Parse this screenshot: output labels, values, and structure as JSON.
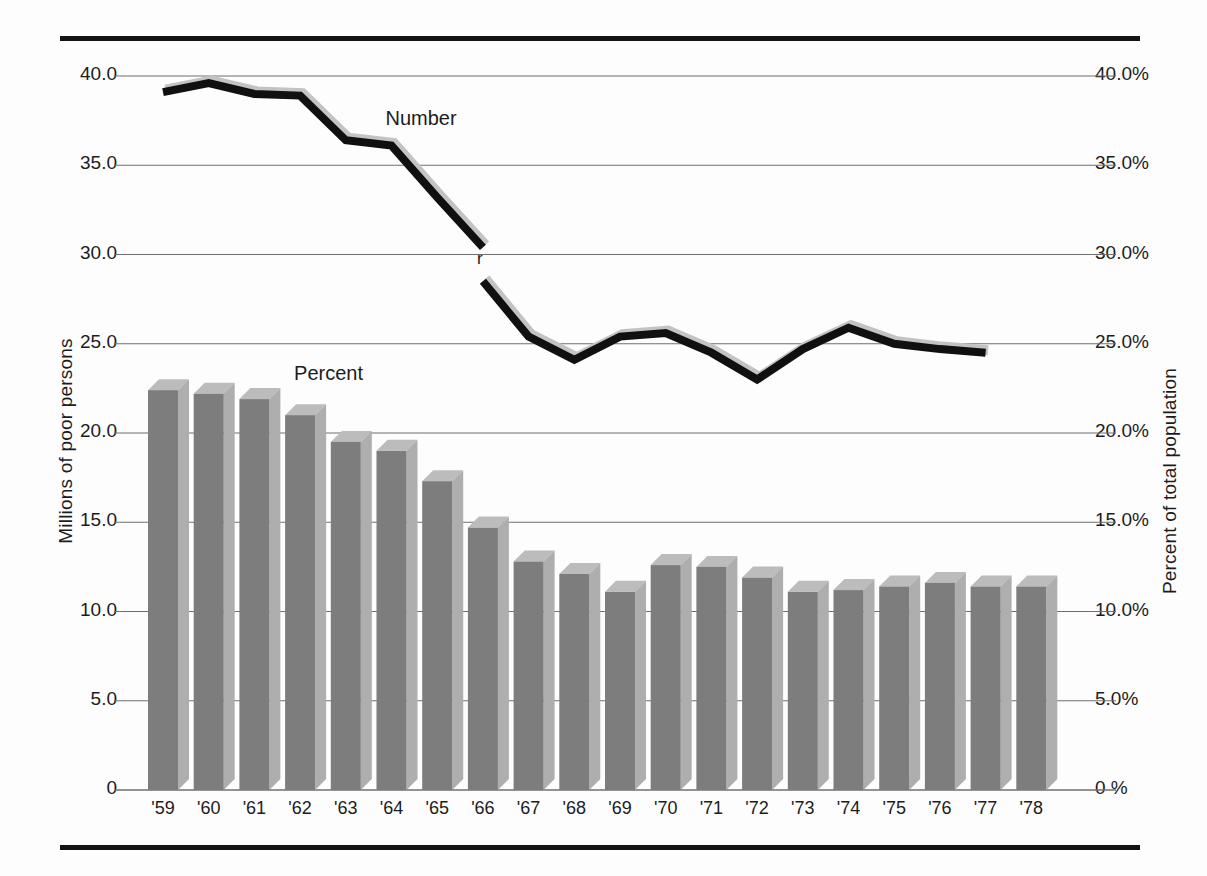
{
  "figure": {
    "left_axis_title": "Millions of  poor persons",
    "right_axis_title": "Percent of  total population",
    "series_label_number": "Number",
    "series_label_percent": "Percent",
    "revision_note": "r"
  },
  "chart_data": {
    "type": "bar",
    "title": "",
    "subtitle": "",
    "xlabel": "",
    "ylabel": "Millions of  poor persons",
    "y2label": "Percent of  total population",
    "grid": true,
    "legend_position": "inline-annotations",
    "categories": [
      "'59",
      "'60",
      "'61",
      "'62",
      "'63",
      "'64",
      "'65",
      "'66",
      "'67",
      "'68",
      "'69",
      "'70",
      "'71",
      "'72",
      "'73",
      "'74",
      "'75",
      "'76",
      "'77",
      "'78"
    ],
    "ylim": [
      0,
      42.5
    ],
    "y2lim": [
      0,
      42.5
    ],
    "left_ticks": [
      "40.0",
      "35.0",
      "30.0",
      "25.0",
      "20.0",
      "15.0",
      "10.0",
      "5.0",
      "0"
    ],
    "left_tick_values": [
      40.0,
      35.0,
      30.0,
      25.0,
      20.0,
      15.0,
      10.0,
      5.0,
      0
    ],
    "right_ticks": [
      "40.0%",
      "35.0%",
      "30.0%",
      "25.0%",
      "20.0%",
      "15.0%",
      "10.0%",
      "5.0%",
      "0 %"
    ],
    "right_tick_values": [
      40.0,
      35.0,
      30.0,
      25.0,
      20.0,
      15.0,
      10.0,
      5.0,
      0
    ],
    "series": [
      {
        "name": "Number",
        "type": "line",
        "unit": "millions of poor persons",
        "break_after_category": "'66",
        "values": [
          39.1,
          39.6,
          39.0,
          38.9,
          36.4,
          36.1,
          33.2,
          30.4,
          27.8,
          25.4,
          24.1,
          25.4,
          25.6,
          24.5,
          23.0,
          24.7,
          25.9,
          25.0,
          24.7,
          24.5
        ],
        "values_after_break": [
          28.5,
          25.4,
          24.1,
          25.4,
          25.6,
          24.5,
          23.0,
          24.7,
          25.9,
          25.0,
          24.7,
          24.5
        ]
      },
      {
        "name": "Percent",
        "type": "bar",
        "unit": "percent of total population",
        "values": [
          22.4,
          22.2,
          21.9,
          21.0,
          19.5,
          19.0,
          17.3,
          14.7,
          12.8,
          12.1,
          11.1,
          12.6,
          12.5,
          11.9,
          11.1,
          11.2,
          11.4,
          11.6,
          11.4,
          11.4
        ]
      }
    ],
    "annotations": [
      {
        "text": "Number",
        "x": "'64",
        "y": 37.5
      },
      {
        "text": "Percent",
        "x": "'62",
        "y": 23.2
      },
      {
        "text": "r",
        "x": "'66",
        "y": 29.5
      }
    ]
  },
  "style": {
    "line_color": "#101010",
    "line_shadow_color": "#c3c3c3",
    "bar_front_color": "#7d7d7d",
    "bar_side_color": "#aeaeae",
    "bar_top_color": "#bcbcbc",
    "grid_color": "#6f6f6f",
    "frame_color": "#141414",
    "background": "#fdfdfd"
  }
}
